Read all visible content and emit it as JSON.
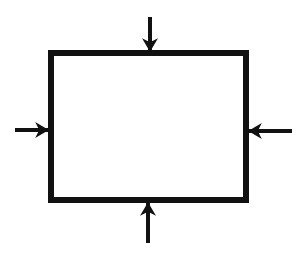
{
  "diagram": {
    "title": "",
    "canvas": {
      "width": 305,
      "height": 259,
      "background": "#ffffff"
    },
    "stroke_color": "#111111",
    "box": {
      "name": "rectangle",
      "x": 51,
      "y": 53,
      "width": 195,
      "height": 147,
      "stroke_width": 6,
      "fill": "#ffffff",
      "label": ""
    },
    "arrows": [
      {
        "name": "top-arrow",
        "direction": "down",
        "x1": 150,
        "y1": 17,
        "x2": 150,
        "y2": 51,
        "stroke_width": 4
      },
      {
        "name": "bottom-arrow",
        "direction": "up",
        "x1": 148,
        "y1": 243,
        "x2": 148,
        "y2": 203,
        "stroke_width": 4
      },
      {
        "name": "left-arrow",
        "direction": "right",
        "x1": 15,
        "y1": 130,
        "x2": 48,
        "y2": 130,
        "stroke_width": 4
      },
      {
        "name": "right-arrow",
        "direction": "left",
        "x1": 292,
        "y1": 131,
        "x2": 249,
        "y2": 131,
        "stroke_width": 4
      }
    ]
  }
}
